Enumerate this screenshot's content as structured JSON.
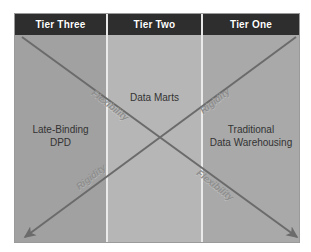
{
  "figure": {
    "type": "quadrant-diagram",
    "colors": {
      "header_bar": "#2e2e2e",
      "header_text": "#ffffff",
      "panel_left": "#a1a1a1",
      "panel_center": "#b6b6b6",
      "panel_right": "#a9a9a9",
      "divider": "#eaeaea",
      "arrow": "#6b6b6b",
      "body_text": "#333333",
      "caption_text": "#8e8e8e",
      "frame_border": "#9a9a9a",
      "page_background": "#ffffff"
    }
  },
  "header": {
    "tiers": [
      {
        "label": "Tier Three"
      },
      {
        "label": "Tier Two"
      },
      {
        "label": "Tier One"
      }
    ]
  },
  "panels": [
    {
      "name": "tier-three",
      "line1": "Late-Binding",
      "line2": "DPD"
    },
    {
      "name": "tier-two",
      "line1": "Data Marts",
      "line2": ""
    },
    {
      "name": "tier-one",
      "line1": "Traditional",
      "line2": "Data Warehousing"
    }
  ],
  "axes": {
    "flexibility_top": "Flexibility",
    "rigidity_top": "Rigidity",
    "rigidity_bottom": "Rigidity",
    "flexibility_bottom": "Flexibility"
  },
  "arrows": [
    {
      "name": "flexibility-arrow",
      "direction": "top-left-to-bottom-right",
      "arrowhead": "bottom-right"
    },
    {
      "name": "rigidity-arrow",
      "direction": "top-right-to-bottom-left",
      "arrowhead": "bottom-left"
    }
  ]
}
